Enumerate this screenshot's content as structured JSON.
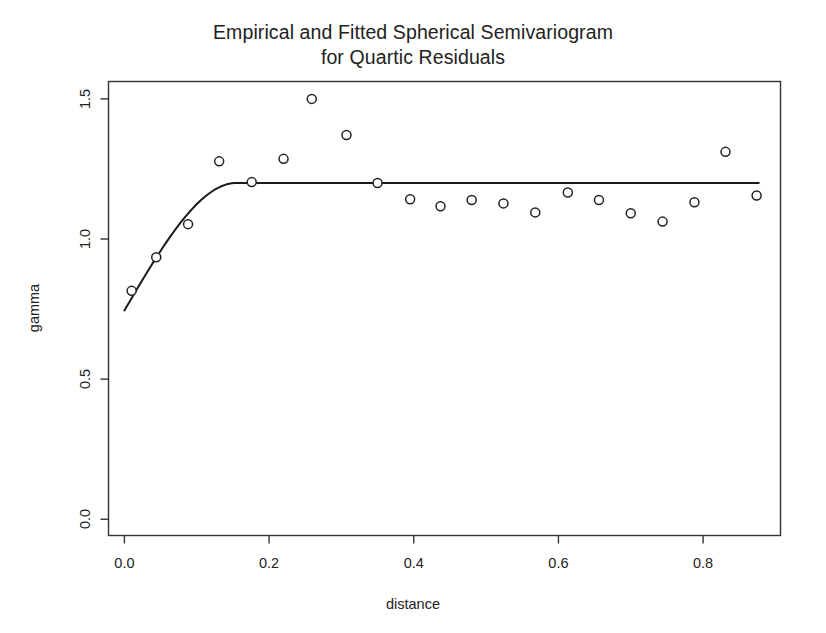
{
  "chart_data": {
    "type": "scatter",
    "title": "Empirical and Fitted Spherical Semivariogram for Quartic Residuals",
    "title_lines": [
      "Empirical and Fitted Spherical Semivariogram",
      "for Quartic Residuals"
    ],
    "xlabel": "distance",
    "ylabel": "gamma",
    "xlim": [
      -0.022,
      0.907
    ],
    "ylim": [
      -0.058,
      1.562
    ],
    "xticks": [
      0.0,
      0.2,
      0.4,
      0.6,
      0.8
    ],
    "xtick_labels": [
      "0.0",
      "0.2",
      "0.4",
      "0.6",
      "0.8"
    ],
    "yticks": [
      0.0,
      0.5,
      1.0,
      1.5
    ],
    "ytick_labels": [
      "0.0",
      "0.5",
      "1.0",
      "1.5"
    ],
    "grid": false,
    "legend": null,
    "frame": "box",
    "series": [
      {
        "name": "Empirical semivariogram",
        "type": "scatter",
        "marker": "open-circle",
        "marker_size": 4.5,
        "color": "#222222",
        "x": [
          0.01,
          0.044,
          0.088,
          0.131,
          0.176,
          0.22,
          0.259,
          0.307,
          0.35,
          0.395,
          0.437,
          0.48,
          0.524,
          0.568,
          0.613,
          0.656,
          0.7,
          0.744,
          0.788,
          0.831,
          0.874
        ],
        "y": [
          0.815,
          0.935,
          1.053,
          1.277,
          1.203,
          1.286,
          1.5,
          1.371,
          1.2,
          1.142,
          1.117,
          1.139,
          1.127,
          1.095,
          1.166,
          1.139,
          1.092,
          1.062,
          1.131,
          1.311,
          1.155
        ]
      },
      {
        "name": "Fitted spherical model",
        "type": "line",
        "color": "#1a1a1a",
        "line_width": 2.0,
        "model": "spherical",
        "nugget": 0.745,
        "sill": 1.2,
        "partial_sill": 0.455,
        "range": 0.155,
        "x_start": 0.0,
        "x_end": 0.877
      }
    ]
  }
}
